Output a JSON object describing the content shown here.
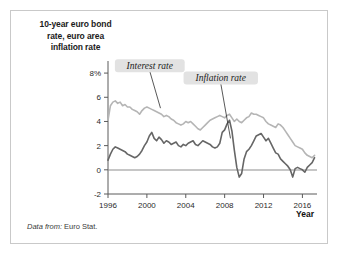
{
  "figure": {
    "title": "10-year euro bond rate, euro area inflation rate",
    "title_line1": "10-year euro bond",
    "title_line2": "rate, euro area",
    "title_line3": "inflation rate",
    "source_prefix": "Data from:",
    "source_value": " Euro Stat.",
    "border_color": "#c9c9c9",
    "background": "#ffffff"
  },
  "chart_data": {
    "type": "line",
    "title": "10-year euro bond rate, euro area inflation rate",
    "xlabel": "Year",
    "ylabel": "",
    "xlim": [
      1996,
      2017.5
    ],
    "ylim": [
      -2,
      9
    ],
    "grid": false,
    "legend": "annotations-inline",
    "xticks": [
      1996,
      2000,
      2004,
      2008,
      2012,
      2016
    ],
    "xticklabels": [
      "1996",
      "2000",
      "2004",
      "2008",
      "2012",
      "2016"
    ],
    "yticks": [
      -2,
      0,
      2,
      4,
      6,
      8
    ],
    "yticklabels": [
      "-2",
      "0",
      "2",
      "4",
      "6",
      "8%"
    ],
    "zero_reference_line": 0,
    "annotations": [
      {
        "label": "Interest rate",
        "series": "Interest rate",
        "x": 2000.3,
        "y": 8.6,
        "points_to_x": 2001.4,
        "points_to_y": 5.1
      },
      {
        "label": "Inflation rate",
        "series": "Inflation rate",
        "x": 2007.6,
        "y": 7.6,
        "points_to_x": 2008.6,
        "points_to_y": 2.6
      }
    ],
    "series": [
      {
        "name": "Interest rate",
        "color": "#b5b5b5",
        "x": [
          1996.0,
          1996.25,
          1996.5,
          1996.75,
          1997.0,
          1997.25,
          1997.5,
          1997.75,
          1998.0,
          1998.25,
          1998.5,
          1998.75,
          1999.0,
          1999.25,
          1999.5,
          1999.75,
          2000.0,
          2000.25,
          2000.5,
          2000.75,
          2001.0,
          2001.25,
          2001.5,
          2001.75,
          2002.0,
          2002.25,
          2002.5,
          2002.75,
          2003.0,
          2003.25,
          2003.5,
          2003.75,
          2004.0,
          2004.25,
          2004.5,
          2004.75,
          2005.0,
          2005.25,
          2005.5,
          2005.75,
          2006.0,
          2006.25,
          2006.5,
          2006.75,
          2007.0,
          2007.25,
          2007.5,
          2007.75,
          2008.0,
          2008.25,
          2008.5,
          2008.75,
          2009.0,
          2009.25,
          2009.5,
          2009.75,
          2010.0,
          2010.25,
          2010.5,
          2010.75,
          2011.0,
          2011.25,
          2011.5,
          2011.75,
          2012.0,
          2012.25,
          2012.5,
          2012.75,
          2013.0,
          2013.25,
          2013.5,
          2013.75,
          2014.0,
          2014.25,
          2014.5,
          2014.75,
          2015.0,
          2015.25,
          2015.5,
          2015.75,
          2016.0,
          2016.25,
          2016.5,
          2016.75,
          2017.0,
          2017.25
        ],
        "y": [
          4.1,
          5.3,
          5.6,
          5.7,
          5.5,
          5.6,
          5.3,
          5.4,
          5.2,
          5.2,
          5.0,
          4.9,
          4.8,
          4.6,
          4.9,
          5.1,
          5.2,
          5.1,
          5.0,
          4.9,
          4.8,
          4.7,
          4.6,
          4.4,
          4.5,
          4.4,
          4.2,
          4.1,
          3.9,
          3.8,
          3.7,
          3.8,
          4.0,
          3.9,
          4.0,
          3.8,
          3.6,
          3.4,
          3.3,
          3.5,
          3.7,
          3.9,
          4.1,
          4.2,
          4.3,
          4.4,
          4.5,
          4.4,
          4.3,
          4.5,
          4.6,
          4.3,
          4.0,
          4.2,
          4.0,
          3.9,
          4.1,
          4.3,
          4.4,
          4.7,
          4.6,
          4.6,
          4.5,
          4.4,
          4.3,
          4.0,
          3.8,
          3.7,
          3.6,
          3.5,
          3.8,
          3.7,
          3.5,
          3.2,
          2.9,
          2.6,
          2.3,
          2.0,
          1.9,
          1.8,
          1.7,
          1.4,
          1.2,
          1.1,
          1.0,
          1.2
        ]
      },
      {
        "name": "Inflation rate",
        "color": "#666666",
        "x": [
          1996.0,
          1996.25,
          1996.5,
          1996.75,
          1997.0,
          1997.25,
          1997.5,
          1997.75,
          1998.0,
          1998.25,
          1998.5,
          1998.75,
          1999.0,
          1999.25,
          1999.5,
          1999.75,
          2000.0,
          2000.25,
          2000.5,
          2000.75,
          2001.0,
          2001.25,
          2001.5,
          2001.75,
          2002.0,
          2002.25,
          2002.5,
          2002.75,
          2003.0,
          2003.25,
          2003.5,
          2003.75,
          2004.0,
          2004.25,
          2004.5,
          2004.75,
          2005.0,
          2005.25,
          2005.5,
          2005.75,
          2006.0,
          2006.25,
          2006.5,
          2006.75,
          2007.0,
          2007.25,
          2007.5,
          2007.75,
          2008.0,
          2008.25,
          2008.5,
          2008.75,
          2009.0,
          2009.25,
          2009.5,
          2009.75,
          2010.0,
          2010.25,
          2010.5,
          2010.75,
          2011.0,
          2011.25,
          2011.5,
          2011.75,
          2012.0,
          2012.25,
          2012.5,
          2012.75,
          2013.0,
          2013.25,
          2013.5,
          2013.75,
          2014.0,
          2014.25,
          2014.5,
          2014.75,
          2015.0,
          2015.25,
          2015.5,
          2015.75,
          2016.0,
          2016.25,
          2016.5,
          2016.75,
          2017.0,
          2017.25
        ],
        "y": [
          0.8,
          1.3,
          1.7,
          1.9,
          1.8,
          1.7,
          1.6,
          1.5,
          1.3,
          1.2,
          1.1,
          1.0,
          1.1,
          1.3,
          1.6,
          2.0,
          2.3,
          2.8,
          3.1,
          2.6,
          2.4,
          2.7,
          2.5,
          2.2,
          2.4,
          2.3,
          2.1,
          2.2,
          2.3,
          2.0,
          1.9,
          2.1,
          2.0,
          2.2,
          2.3,
          2.4,
          2.1,
          2.0,
          2.2,
          2.4,
          2.3,
          2.2,
          2.1,
          1.9,
          1.8,
          1.9,
          2.2,
          3.1,
          3.3,
          3.8,
          4.1,
          3.2,
          1.6,
          0.2,
          -0.6,
          -0.3,
          0.9,
          1.5,
          1.7,
          2.0,
          2.4,
          2.8,
          2.9,
          3.0,
          2.7,
          2.4,
          2.6,
          2.2,
          1.8,
          1.4,
          1.3,
          0.9,
          0.7,
          0.5,
          0.3,
          0.0,
          -0.6,
          0.1,
          0.2,
          0.1,
          0.0,
          -0.2,
          0.2,
          0.4,
          0.6,
          1.0
        ]
      }
    ]
  }
}
